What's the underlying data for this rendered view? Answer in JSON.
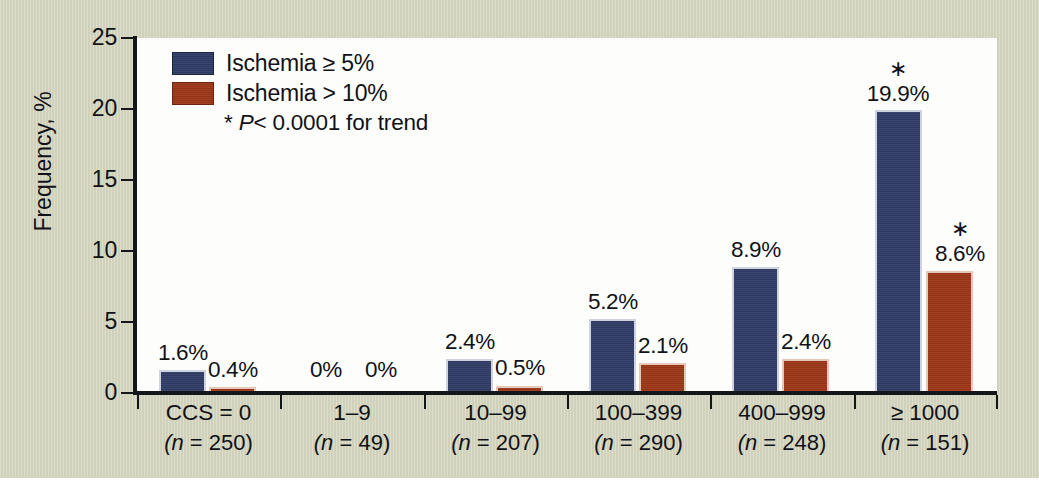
{
  "chart_data": {
    "type": "bar",
    "title": "",
    "xlabel": "",
    "ylabel": "Frequency, %",
    "ylim": [
      0,
      25
    ],
    "yticks": [
      0,
      5,
      10,
      15,
      20,
      25
    ],
    "ytick_labels": [
      "0",
      "5",
      "10",
      "15",
      "20",
      "25"
    ],
    "grid": false,
    "legend_position": "top-left",
    "categories": [
      "CCS = 0",
      "1–9",
      "10–99",
      "100–399",
      "400–999",
      "≥ 1000"
    ],
    "category_counts": [
      "(n = 250)",
      "(n = 49)",
      "(n = 207)",
      "(n = 290)",
      "(n = 248)",
      "(n = 151)"
    ],
    "series": [
      {
        "name": "Ischemia ≥ 5%",
        "color": "#2f3c66",
        "values": [
          1.6,
          0,
          2.4,
          5.2,
          8.9,
          19.9
        ],
        "labels": [
          "1.6%",
          "0%",
          "2.4%",
          "5.2%",
          "8.9%",
          "19.9%"
        ],
        "stars": [
          false,
          false,
          false,
          false,
          false,
          true
        ]
      },
      {
        "name": "Ischemia > 10%",
        "color": "#9c3617",
        "values": [
          0.4,
          0,
          0.5,
          2.1,
          2.4,
          8.6
        ],
        "labels": [
          "0.4%",
          "0%",
          "0.5%",
          "2.1%",
          "2.4%",
          "8.6%"
        ],
        "stars": [
          false,
          false,
          false,
          false,
          false,
          true
        ]
      }
    ],
    "annotations": [
      {
        "text": "* P< 0.0001 for trend",
        "position": "legend"
      }
    ]
  },
  "legend": {
    "items": [
      {
        "label": "Ischemia ≥ 5%",
        "swatch": "blue"
      },
      {
        "label": "Ischemia > 10%",
        "swatch": "red"
      }
    ],
    "note_star": "*",
    "note_p": "P",
    "note_rest": "< 0.0001 for trend"
  },
  "axes": {
    "y_title": "Frequency, %",
    "y_ticks": [
      "25",
      "20",
      "15",
      "10",
      "5",
      "0"
    ]
  },
  "colors": {
    "series_blue": "#2f3c66",
    "series_red": "#9c3617",
    "background": "#d3d4be",
    "plot_background": "#fdfdfb",
    "axis": "#15161a",
    "text": "#111217"
  },
  "star_symbol": "∗"
}
